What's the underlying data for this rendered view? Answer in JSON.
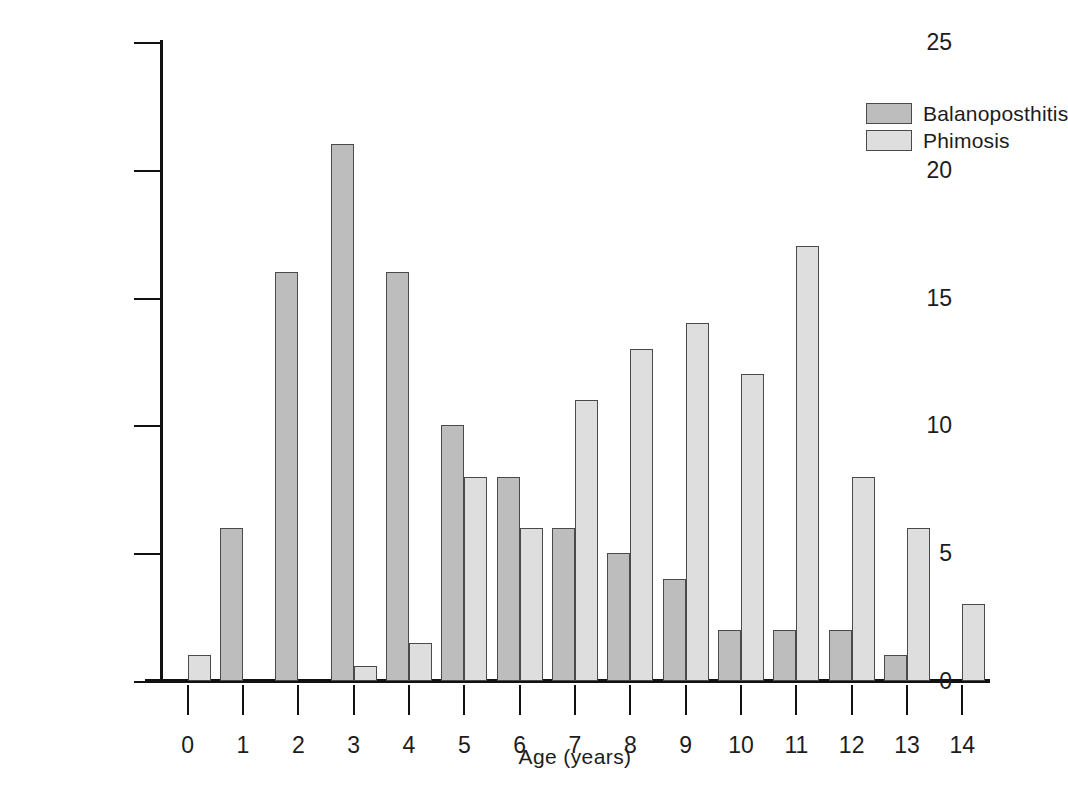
{
  "chart_data": {
    "type": "bar",
    "title": "",
    "xlabel": "Age (years)",
    "ylabel": "% of patients",
    "categories": [
      "0",
      "1",
      "2",
      "3",
      "4",
      "5",
      "6",
      "7",
      "8",
      "9",
      "10",
      "11",
      "12",
      "13",
      "14"
    ],
    "series": [
      {
        "name": "Balanoposthitis",
        "color": "#bdbdbd",
        "values": [
          0,
          6,
          16,
          21,
          16,
          10,
          8,
          6,
          5,
          4,
          2,
          2,
          2,
          1,
          0
        ]
      },
      {
        "name": "Phimosis",
        "color": "#dedede",
        "values": [
          1,
          0,
          0,
          0.6,
          1.5,
          8,
          6,
          11,
          13,
          14,
          12,
          17,
          8,
          6,
          3
        ]
      }
    ],
    "ylim": [
      0,
      25
    ],
    "yticks": [
      0,
      5,
      10,
      15,
      20,
      25
    ],
    "ytick_labels": [
      "0",
      "5",
      "10",
      "15",
      "20",
      "25"
    ],
    "grid": false,
    "legend_position": "top-right",
    "bar_edge_color": "#4a4a4a",
    "axis_color": "#111111"
  },
  "legend": {
    "entries": [
      {
        "label": "Balanoposthitis",
        "color": "#bdbdbd"
      },
      {
        "label": "Phimosis",
        "color": "#dedede"
      }
    ]
  }
}
